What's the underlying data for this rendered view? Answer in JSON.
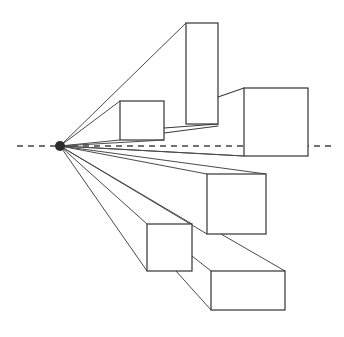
{
  "diagram": {
    "colors": {
      "background": "#ffffff",
      "line": "#3a3a3a",
      "horizon": "#444444",
      "vanishing_point": "#2b2b2b"
    },
    "horizon_line": {
      "y": 146,
      "x1": 17,
      "x2": 334,
      "style": "dashed"
    },
    "vanishing_point": {
      "x": 60,
      "y": 146,
      "r": 5
    },
    "boxes": [
      {
        "name": "box-upper-small",
        "front": {
          "x": 120,
          "y": 101,
          "w": 44,
          "h": 39
        }
      },
      {
        "name": "box-tall",
        "front": {
          "x": 186,
          "y": 23,
          "w": 32,
          "h": 101
        }
      },
      {
        "name": "box-right",
        "front": {
          "x": 244,
          "y": 88,
          "w": 64,
          "h": 68
        }
      },
      {
        "name": "box-mid-right",
        "front": {
          "x": 207,
          "y": 174,
          "w": 59,
          "h": 60
        }
      },
      {
        "name": "box-lower-left",
        "front": {
          "x": 147,
          "y": 224,
          "w": 45,
          "h": 47
        }
      },
      {
        "name": "box-bottom",
        "front": {
          "x": 211,
          "y": 271,
          "w": 74,
          "h": 39
        }
      }
    ]
  }
}
